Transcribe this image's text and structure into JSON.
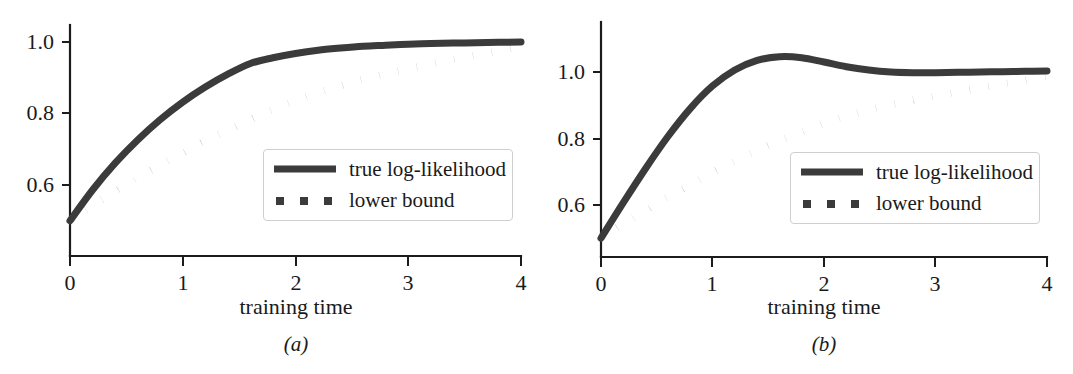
{
  "figure": {
    "background_color": "#ffffff",
    "ink_color": "#3b3b3b",
    "text_color": "#1a1a1a",
    "legend_border_color": "#cfcfcf"
  },
  "panels": [
    {
      "id": "a",
      "subcaption": "(a)",
      "xlabel": "training time",
      "xticks": [
        "0",
        "1",
        "2",
        "3",
        "4"
      ],
      "yticks": [
        "1.0",
        "0.8",
        "0.6"
      ],
      "legend": {
        "items": [
          {
            "label": "true log-likelihood",
            "style": "solid"
          },
          {
            "label": "lower bound",
            "style": "dotted"
          }
        ]
      }
    },
    {
      "id": "b",
      "subcaption": "(b)",
      "xlabel": "training time",
      "xticks": [
        "0",
        "1",
        "2",
        "3",
        "4"
      ],
      "yticks": [
        "1.0",
        "0.8",
        "0.6"
      ],
      "legend": {
        "items": [
          {
            "label": "true log-likelihood",
            "style": "solid"
          },
          {
            "label": "lower bound",
            "style": "dotted"
          }
        ]
      }
    }
  ],
  "chart_data": [
    {
      "type": "line",
      "panel": "a",
      "title": "",
      "xlabel": "training time",
      "ylabel": "",
      "xlim": [
        0,
        4
      ],
      "ylim": [
        0.48,
        1.04
      ],
      "xticks": [
        0,
        1,
        2,
        3,
        4
      ],
      "yticks": [
        0.6,
        0.8,
        1.0
      ],
      "grid": false,
      "legend_position": "lower-right-inside",
      "x": [
        0,
        0.2,
        0.4,
        0.6,
        0.8,
        1.0,
        1.2,
        1.4,
        1.6,
        1.8,
        2.0,
        2.2,
        2.4,
        2.6,
        2.8,
        3.0,
        3.2,
        3.4,
        3.6,
        3.8,
        4.0
      ],
      "series": [
        {
          "name": "true log-likelihood",
          "style": "solid",
          "values": [
            0.5,
            0.586,
            0.661,
            0.726,
            0.783,
            0.832,
            0.874,
            0.91,
            0.94,
            0.956,
            0.968,
            0.977,
            0.983,
            0.988,
            0.991,
            0.994,
            0.996,
            0.997,
            0.998,
            0.999,
            1.0
          ]
        },
        {
          "name": "lower bound",
          "style": "dotted",
          "values": [
            0.5,
            0.542,
            0.581,
            0.619,
            0.655,
            0.69,
            0.723,
            0.754,
            0.783,
            0.811,
            0.836,
            0.858,
            0.878,
            0.895,
            0.911,
            0.925,
            0.939,
            0.952,
            0.964,
            0.975,
            0.987
          ]
        }
      ]
    },
    {
      "type": "line",
      "panel": "b",
      "title": "",
      "xlabel": "training time",
      "ylabel": "",
      "xlim": [
        0,
        4
      ],
      "ylim": [
        0.48,
        1.13
      ],
      "xticks": [
        0,
        1,
        2,
        3,
        4
      ],
      "yticks": [
        0.6,
        0.8,
        1.0
      ],
      "grid": false,
      "legend_position": "lower-right-inside",
      "x": [
        0,
        0.2,
        0.4,
        0.6,
        0.8,
        1.0,
        1.2,
        1.4,
        1.6,
        1.8,
        2.0,
        2.2,
        2.4,
        2.6,
        2.8,
        3.0,
        3.2,
        3.4,
        3.6,
        3.8,
        4.0
      ],
      "series": [
        {
          "name": "true log-likelihood",
          "style": "solid",
          "values": [
            0.5,
            0.607,
            0.71,
            0.806,
            0.89,
            0.958,
            1.006,
            1.035,
            1.046,
            1.043,
            1.03,
            1.016,
            1.006,
            1.0,
            0.998,
            0.998,
            0.999,
            1.0,
            1.001,
            1.002,
            1.003
          ]
        },
        {
          "name": "lower bound",
          "style": "dotted",
          "values": [
            0.5,
            0.543,
            0.584,
            0.623,
            0.661,
            0.697,
            0.731,
            0.763,
            0.793,
            0.82,
            0.845,
            0.867,
            0.886,
            0.902,
            0.916,
            0.928,
            0.94,
            0.952,
            0.964,
            0.975,
            0.987
          ]
        }
      ]
    }
  ]
}
